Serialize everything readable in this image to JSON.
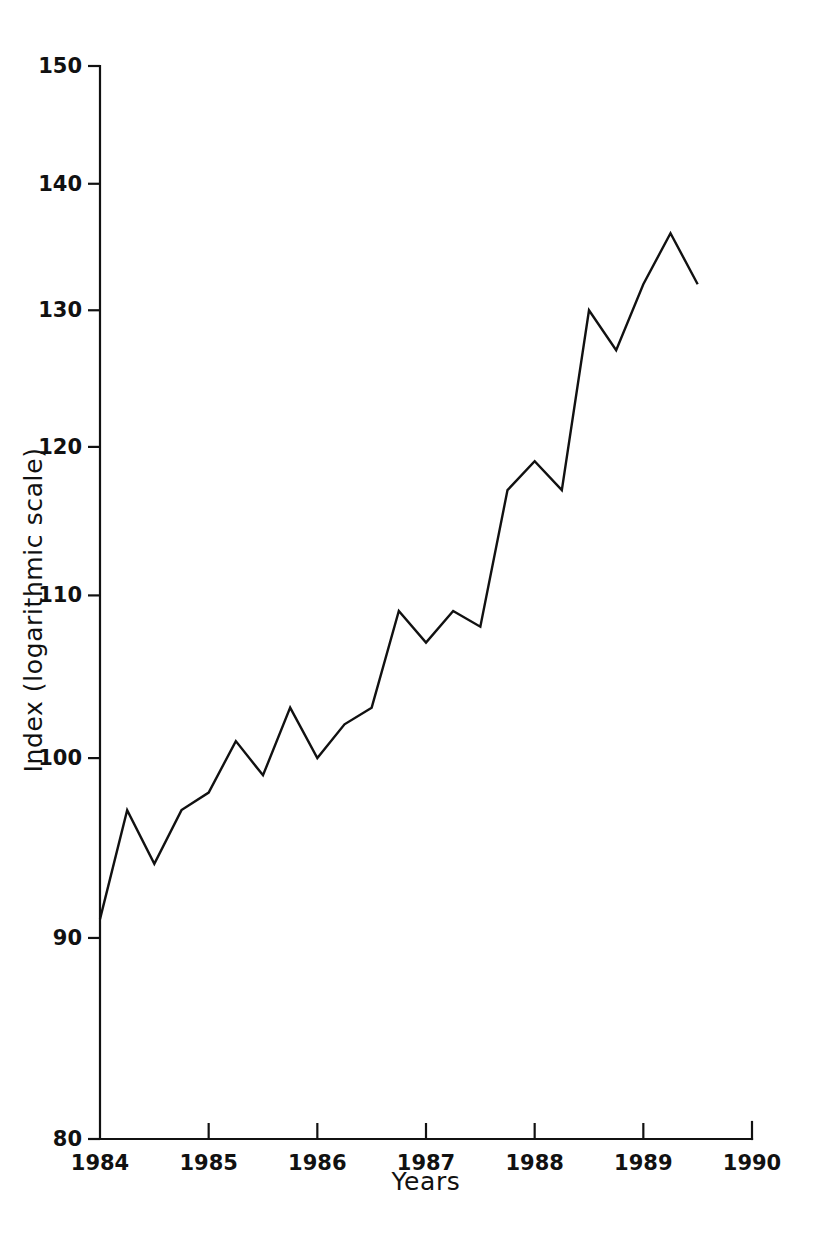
{
  "chart_data": {
    "type": "line",
    "title": "",
    "xlabel": "Years",
    "ylabel": "Index (logarithmic scale)",
    "yscale": "log",
    "ylim": [
      80,
      150
    ],
    "xlim": [
      1984,
      1990
    ],
    "grid": false,
    "legend": false,
    "y_ticks": [
      150,
      140,
      130,
      120,
      110,
      100,
      90,
      80
    ],
    "y_tick_labels": [
      "150",
      "140",
      "130",
      "120",
      "110",
      "100",
      "90",
      "80"
    ],
    "x_ticks": [
      1984,
      1985,
      1986,
      1987,
      1988,
      1989,
      1990
    ],
    "x_tick_labels": [
      "1984",
      "1985",
      "1986",
      "1987",
      "1988",
      "1989",
      "1990"
    ],
    "series": [
      {
        "name": "Index",
        "color": "#111111",
        "x": [
          1984.0,
          1984.25,
          1984.5,
          1984.75,
          1985.0,
          1985.25,
          1985.5,
          1985.75,
          1986.0,
          1986.25,
          1986.5,
          1986.75,
          1987.0,
          1987.25,
          1987.5,
          1987.75,
          1988.0,
          1988.25,
          1988.5,
          1988.75,
          1989.0,
          1989.25,
          1989.5
        ],
        "values": [
          91,
          97,
          94,
          97,
          98,
          101,
          99,
          103,
          100,
          102,
          103,
          109,
          107,
          109,
          108,
          117,
          119,
          117,
          130,
          127,
          132,
          136,
          132
        ]
      }
    ]
  },
  "axes": {
    "y_axis_name": "y-axis",
    "x_axis_name": "x-axis"
  }
}
